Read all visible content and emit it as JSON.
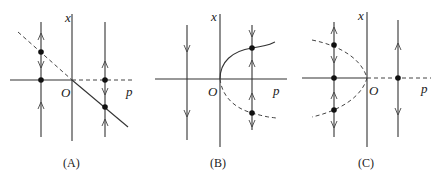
{
  "figure": {
    "panels": [
      {
        "id": "A",
        "caption": "(A)",
        "x_axis_label": "p",
        "y_axis_label": "x",
        "origin_label": "O",
        "bifurcation_type": "transcritical",
        "branches": [
          {
            "name": "x=0, p<0",
            "style": "solid",
            "stability": "stable"
          },
          {
            "name": "x=0, p>0",
            "style": "dashed",
            "stability": "unstable"
          },
          {
            "name": "x=-p, p<0",
            "style": "dashed",
            "stability": "unstable"
          },
          {
            "name": "x=-p, p>0",
            "style": "solid",
            "stability": "stable"
          }
        ],
        "flow_lines": [
          {
            "side": "p<0",
            "equilibria": 2
          },
          {
            "side": "p>0",
            "equilibria": 2
          }
        ]
      },
      {
        "id": "B",
        "caption": "(B)",
        "x_axis_label": "p",
        "y_axis_label": "x",
        "origin_label": "O",
        "bifurcation_type": "saddle-node",
        "branches": [
          {
            "name": "x=+sqrt(p)",
            "style": "solid",
            "stability": "stable"
          },
          {
            "name": "x=-sqrt(p)",
            "style": "dashed",
            "stability": "unstable"
          }
        ],
        "flow_lines": [
          {
            "side": "p<0",
            "equilibria": 0
          },
          {
            "side": "p>0",
            "equilibria": 2
          }
        ]
      },
      {
        "id": "C",
        "caption": "(C)",
        "x_axis_label": "p",
        "y_axis_label": "x",
        "origin_label": "O",
        "bifurcation_type": "subcritical pitchfork",
        "branches": [
          {
            "name": "x=0, p<0",
            "style": "solid",
            "stability": "stable"
          },
          {
            "name": "x=0, p>0",
            "style": "dashed",
            "stability": "unstable"
          },
          {
            "name": "x=±sqrt(-p)",
            "style": "dashed",
            "stability": "unstable"
          }
        ],
        "flow_lines": [
          {
            "side": "p<0",
            "equilibria": 3
          },
          {
            "side": "p>0",
            "equilibria": 1
          }
        ]
      }
    ]
  }
}
